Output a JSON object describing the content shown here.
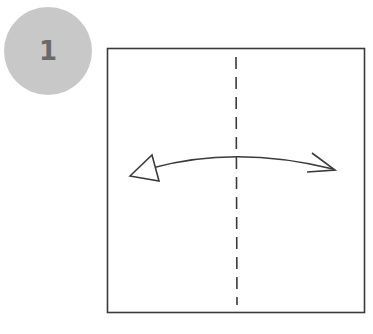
{
  "step": {
    "number": "1"
  },
  "colors": {
    "badge_bg": "#c8c8c8",
    "badge_text": "#6a6a6a",
    "line": "#3a3a3a",
    "paper": "#ffffff"
  },
  "diagram": {
    "paper": {
      "shape": "square",
      "x": 107,
      "y": 48,
      "width": 257,
      "height": 264
    },
    "fold_line": {
      "type": "valley-fold-dashed",
      "orientation": "vertical",
      "x": 236
    },
    "arrow": {
      "type": "fold-and-unfold-arrow",
      "direction": "bidirectional-horizontal",
      "left_head": "hollow-triangle",
      "right_head": "open-barb"
    }
  }
}
